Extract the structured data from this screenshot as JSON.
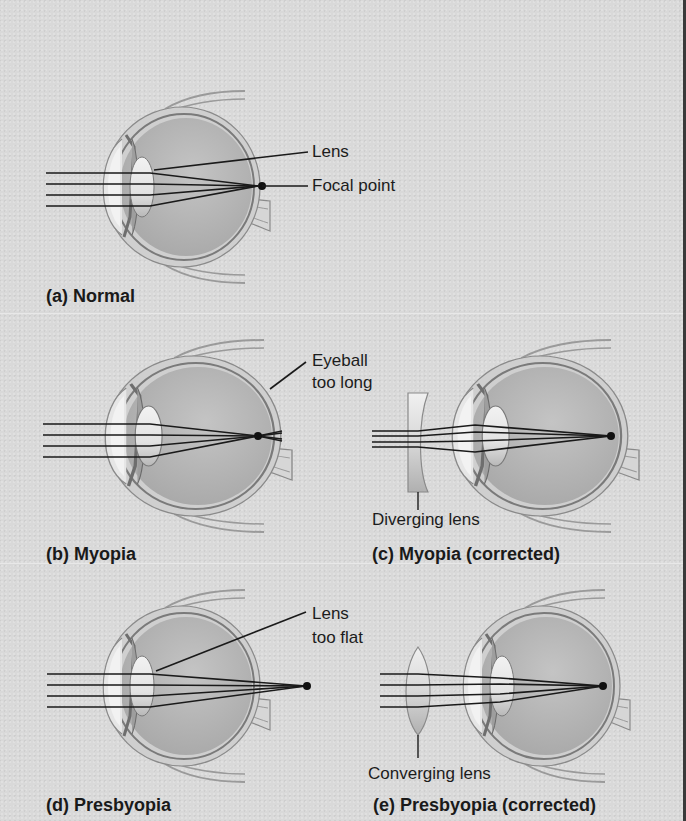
{
  "figure": {
    "panels": [
      {
        "id": "a",
        "caption": "(a) Normal",
        "labels": [
          "Lens",
          "Focal point"
        ]
      },
      {
        "id": "b",
        "caption": "(b) Myopia",
        "labels": [
          "Eyeball",
          "too long"
        ]
      },
      {
        "id": "c",
        "caption": "(c) Myopia (corrected)",
        "labels": [
          "Diverging lens"
        ]
      },
      {
        "id": "d",
        "caption": "(d) Presbyopia",
        "labels": [
          "Lens",
          "too flat"
        ]
      },
      {
        "id": "e",
        "caption": "(e) Presbyopia (corrected)",
        "labels": [
          "Converging lens"
        ]
      }
    ],
    "colors": {
      "background": "#d9d9d9",
      "eyeball_fill": "#b3b3b3",
      "sclera": "#c8c8c8",
      "outline": "#6a6a6a",
      "ray": "#1a1a1a",
      "edge": "#3a3a3a"
    }
  }
}
